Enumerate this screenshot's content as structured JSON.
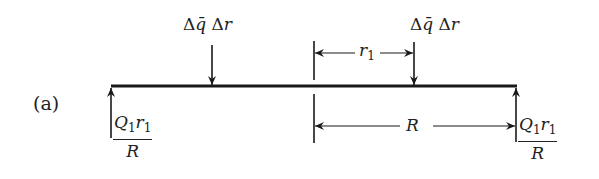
{
  "figure": {
    "case_label": "(a)",
    "beam": {
      "span_start_x": 111,
      "span_end_x": 516,
      "y": 86
    },
    "loads": [
      {
        "id": "load-left",
        "delta": "Δ",
        "q": "q̄",
        "delta2": "Δ",
        "r": "r",
        "x": 212
      },
      {
        "id": "load-right",
        "delta": "Δ",
        "q": "q̄",
        "delta2": "Δ",
        "r": "r",
        "x": 414
      }
    ],
    "reactions": [
      {
        "id": "reaction-left",
        "num_Q": "Q",
        "num_Q_sub": "1",
        "num_r": "r",
        "num_r_sub": "1",
        "den": "R",
        "x": 111
      },
      {
        "id": "reaction-right",
        "num_Q": "Q",
        "num_Q_sub": "1",
        "num_r": "r",
        "num_r_sub": "1",
        "den": "R",
        "x": 516
      }
    ],
    "dimensions": {
      "r1": {
        "symbol": "r",
        "sub": "1",
        "from_x": 314,
        "to_x": 414
      },
      "R": {
        "symbol": "R",
        "from_x": 314,
        "to_x": 516
      }
    },
    "centerline_x": 314,
    "line_color": "#1a1a1a"
  }
}
